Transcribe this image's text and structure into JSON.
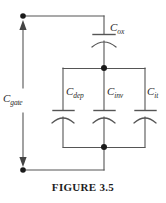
{
  "figure": {
    "caption": "FIGURE 3.5",
    "stroke_color": "#555555",
    "node_color": "#1a1a1a",
    "text_color": "#2b2b2b",
    "background": "#ffffff"
  },
  "labels": {
    "cgate": {
      "symbol": "C",
      "subscript": "gate"
    },
    "cox": {
      "symbol": "C",
      "subscript": "ox"
    },
    "cdep": {
      "symbol": "C",
      "subscript": "dep"
    },
    "cinv": {
      "symbol": "C",
      "subscript": "inv"
    },
    "cit": {
      "symbol": "C",
      "subscript": "it"
    }
  }
}
